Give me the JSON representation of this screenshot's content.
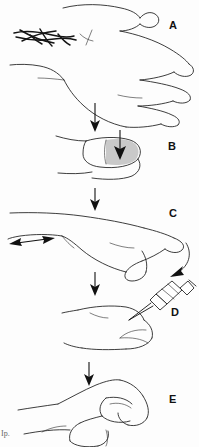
{
  "figure": {
    "background_color": "#fdfdfd",
    "ink_color": "#1b1b1b",
    "shade_color": "#c9c9c9",
    "corner_artifact_text": "Ip."
  },
  "panels": [
    {
      "id": "A",
      "label": "A",
      "label_x": 169,
      "label_y": 20,
      "caption": "Hand in side view with dark scribbled lesion mark over the dorsal wrist",
      "icon": "hand-side-view-with-lesion"
    },
    {
      "id": "B",
      "label": "B",
      "label_x": 168,
      "label_y": 141,
      "caption": "Close-up of fingertip with gray shaded area and downward pressure arrow",
      "icon": "fingertip-shaded-pressure"
    },
    {
      "id": "C",
      "label": "C",
      "label_x": 169,
      "label_y": 208,
      "caption": "Extended finger with horizontal double-headed traction arrow and curved arrow at the tip",
      "icon": "finger-traction-arrows"
    },
    {
      "id": "D",
      "label": "D",
      "label_x": 171,
      "label_y": 307,
      "caption": "Syringe needle inserted into the fingertip at an angle",
      "icon": "syringe-injection-fingertip"
    },
    {
      "id": "E",
      "label": "E",
      "label_x": 169,
      "label_y": 394,
      "caption": "Hand with finger flexed after the procedure",
      "icon": "hand-flexed-finger"
    }
  ],
  "connectors": [
    {
      "name": "arrow-a-to-b",
      "from_panel": "A",
      "to_panel": "B",
      "direction": "down"
    },
    {
      "name": "arrow-b-to-c",
      "from_panel": "B",
      "to_panel": "C",
      "direction": "down"
    },
    {
      "name": "arrow-c-to-d",
      "from_panel": "C",
      "to_panel": "D",
      "direction": "down"
    },
    {
      "name": "arrow-d-to-e",
      "from_panel": "D",
      "to_panel": "E",
      "direction": "down"
    }
  ],
  "annotations": [
    {
      "name": "pressure-arrow",
      "panel": "B",
      "type": "straight-arrow",
      "direction": "down"
    },
    {
      "name": "traction-arrow",
      "panel": "C",
      "type": "double-headed-arrow",
      "direction": "horizontal"
    },
    {
      "name": "tip-curved-arrow",
      "panel": "C",
      "type": "curved-arrow",
      "direction": "down-left"
    }
  ]
}
